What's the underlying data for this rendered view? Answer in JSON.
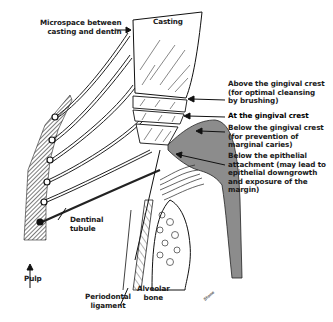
{
  "diagram": {
    "type": "dental cross-section illustration",
    "labels": {
      "microspace": "Microspace between\ncasting and dentin",
      "casting": "Casting",
      "above_crest": "Above the gingival crest\n(for optimal cleansing\nby brushing)",
      "at_crest": "At the gingival crest",
      "below_crest": "Below the gingival crest\n(for prevention of\nmarginal caries)",
      "below_attachment": "Below the epithelial\nattachment (may lead to\nepithelial downgrowth\nand exposure of the\nmargin)",
      "dentinal_tubule": "Dentinal\ntubule",
      "pulp": "Pulp",
      "periodontal_ligament": "Periodontal\nligament",
      "alveolar_bone": "Alveolar\nbone",
      "signature": "Stone"
    },
    "colors": {
      "ink": "#1a1a1a",
      "gingiva": "#8c8c8c",
      "background": "#ffffff"
    }
  }
}
